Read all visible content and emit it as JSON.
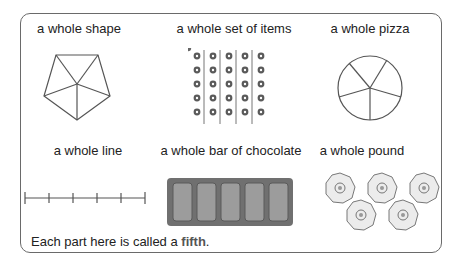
{
  "items": [
    {
      "label": "a whole shape",
      "figure": "pentagon-divided-into-5"
    },
    {
      "label": "a whole set of items",
      "figure": "25-flowers-in-5-columns"
    },
    {
      "label": "a whole pizza",
      "figure": "circle-divided-into-5"
    },
    {
      "label": "a whole line",
      "figure": "line-divided-into-5"
    },
    {
      "label": "a whole bar of chocolate",
      "figure": "bar-with-5-pieces"
    },
    {
      "label": "a whole pound",
      "figure": "five-20p-coins"
    }
  ],
  "caption": {
    "prefix": "Each part here is called a ",
    "emphasis": "fifth",
    "suffix": "."
  },
  "colors": {
    "border": "#6a6a6a",
    "line": "#555555",
    "chocolate_outer": "#6f6f6f",
    "chocolate_piece": "#9a9a9a"
  }
}
